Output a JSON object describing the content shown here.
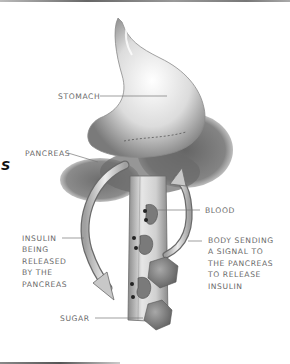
{
  "figure": {
    "title_fragment": "S",
    "labels": {
      "stomach": "STOMACH",
      "pancreas": "PANCREAS",
      "blood": "BLOOD",
      "signal_line1": "BODY SENDING",
      "signal_line2": "A SIGNAL TO",
      "signal_line3": "THE PANCREAS",
      "signal_line4": "TO RELEASE",
      "signal_line5": "INSULIN",
      "insulin_line1": "INSULIN",
      "insulin_line2": "BEING",
      "insulin_line3": "RELEASED",
      "insulin_line4": "BY THE",
      "insulin_line5": "PANCREAS",
      "sugar": "SUGAR"
    },
    "colors": {
      "background": "#ffffff",
      "label_text": "#6a6a6a",
      "leader_line": "#777777",
      "organ_light": "#f2f2f2",
      "organ_shadow": "#5a5a5a"
    }
  }
}
